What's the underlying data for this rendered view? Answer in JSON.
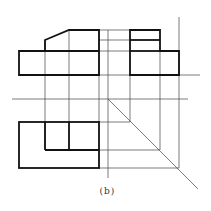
{
  "figure": {
    "caption": "(b)",
    "colors": {
      "outline": "#111111",
      "construction": "#444444",
      "background": "#ffffff"
    }
  },
  "views": {
    "front": {
      "name": "front-view",
      "outline": [
        [
          19,
          51
        ],
        [
          45,
          51
        ],
        [
          45,
          40
        ],
        [
          69,
          30
        ],
        [
          99,
          30
        ],
        [
          99,
          75
        ],
        [
          19,
          75
        ]
      ],
      "inner_lines": [
        [
          [
            45,
            40
          ],
          [
            99,
            40
          ]
        ]
      ]
    },
    "side": {
      "name": "side-view",
      "outline": [
        [
          130,
          51
        ],
        [
          130,
          30
        ],
        [
          160,
          30
        ],
        [
          160,
          51
        ],
        [
          179,
          51
        ],
        [
          179,
          75
        ],
        [
          130,
          75
        ]
      ],
      "inner_lines": [
        [
          [
            130,
            40
          ],
          [
            160,
            40
          ]
        ]
      ]
    },
    "top": {
      "name": "top-view",
      "outline": [
        [
          19,
          122
        ],
        [
          99,
          122
        ],
        [
          99,
          168
        ],
        [
          19,
          168
        ]
      ],
      "inner_lines": [
        [
          [
            45,
            122
          ],
          [
            45,
            150
          ]
        ],
        [
          [
            45,
            150
          ],
          [
            99,
            150
          ]
        ],
        [
          [
            69,
            122
          ],
          [
            69,
            150
          ]
        ]
      ]
    }
  }
}
